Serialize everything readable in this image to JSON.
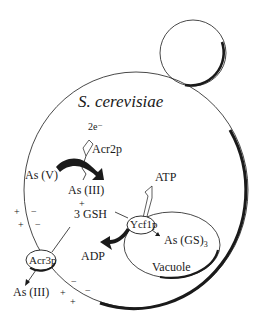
{
  "diagram": {
    "organism": "S. cerevisiae",
    "labels": {
      "electrons": "2e⁻",
      "acr2p": "Acr2p",
      "as_v": "As (V)",
      "as_iii_inner": "As (III)",
      "plus": "+",
      "gsh": "3 GSH",
      "atp": "ATP",
      "ycf1p": "Ycf1p",
      "as_gs3": "As (GS)",
      "as_gs3_sub": "3",
      "adp": "ADP",
      "vacuole": "Vacuole",
      "acr3p": "Acr3p",
      "as_iii_outer": "As (III)"
    },
    "membrane_charges": {
      "left_top_row1": [
        "+",
        "−"
      ],
      "left_top_row2": [
        "+",
        "−"
      ],
      "bottom_inner": [
        "−",
        "−"
      ],
      "bottom_outer": [
        "+",
        "+"
      ]
    },
    "colors": {
      "line": "#1a1a1a",
      "background": "#ffffff"
    }
  }
}
